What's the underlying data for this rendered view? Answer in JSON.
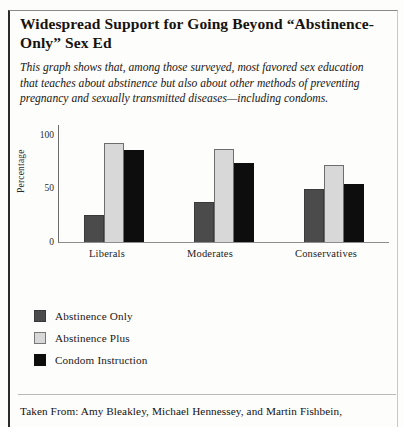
{
  "title": "Widespread Support for Going Beyond “Abstinence-Only” Sex Ed",
  "subtitle": "This graph shows that, among those surveyed, most favored sex education that teaches about abstinence but also about other methods of preventing pregnancy and sexually transmitted diseases—including condoms.",
  "source": "Taken From: Amy Bleakley, Michael Hennessey, and Martin Fishbein,",
  "colors": {
    "abstinence_only": "#4b4b4b",
    "abstinence_plus": "#d8d8d8",
    "condom_instruction": "#0d0d0d",
    "axis": "#6b6b6b",
    "text": "#1b1715"
  },
  "legend": [
    {
      "label": "Abstinence Only",
      "swatch": "s0"
    },
    {
      "label": "Abstinence Plus",
      "swatch": "s1"
    },
    {
      "label": "Condom Instruction",
      "swatch": "s2"
    }
  ],
  "chart_data": {
    "type": "bar",
    "title": "Widespread Support for Going Beyond “Abstinence-Only” Sex Ed",
    "xlabel": "",
    "ylabel": "Percentage",
    "ylim": [
      0,
      110
    ],
    "yticks": [
      0,
      50,
      100
    ],
    "ytick_labels": [
      "0",
      "50",
      "100"
    ],
    "grid": false,
    "legend_position": "below-left",
    "categories": [
      "Liberals",
      "Moderates",
      "Conservatives"
    ],
    "series": [
      {
        "name": "Abstinence Only",
        "color": "#4b4b4b",
        "values": [
          25,
          37,
          49
        ]
      },
      {
        "name": "Abstinence Plus",
        "color": "#d8d8d8",
        "values": [
          93,
          87,
          72
        ]
      },
      {
        "name": "Condom Instruction",
        "color": "#0d0d0d",
        "values": [
          86,
          74,
          54
        ]
      }
    ]
  }
}
